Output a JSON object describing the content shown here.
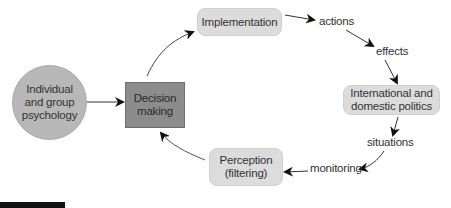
{
  "diagram": {
    "type": "cycle-flow",
    "nodes": {
      "psychology": {
        "label": "Individual and group psychology",
        "lines": [
          "Individual",
          "and group",
          "psychology"
        ],
        "shape": "circle",
        "color": "#b8b8b8"
      },
      "decision": {
        "label": "Decision making",
        "lines": [
          "Decision",
          "making"
        ],
        "shape": "rectangle",
        "color": "#8c8c8c"
      },
      "implementation": {
        "label": "Implementation",
        "lines": [
          "Implementation"
        ],
        "shape": "rounded-rectangle",
        "color": "#dcdcdc"
      },
      "politics": {
        "label": "International and domestic politics",
        "lines": [
          "International and",
          "domestic politics"
        ],
        "shape": "rounded-rectangle",
        "color": "#dcdcdc"
      },
      "perception": {
        "label": "Perception (filtering)",
        "lines": [
          "Perception",
          "(filtering)"
        ],
        "shape": "rounded-rectangle",
        "color": "#dcdcdc"
      }
    },
    "edge_labels": {
      "actions": "actions",
      "effects": "effects",
      "situations": "situations",
      "monitoring": "monitoring"
    },
    "edges": [
      {
        "from": "psychology",
        "to": "decision"
      },
      {
        "from": "decision",
        "to": "implementation"
      },
      {
        "from": "implementation",
        "to": "actions"
      },
      {
        "from": "actions",
        "to": "effects"
      },
      {
        "from": "effects",
        "to": "politics"
      },
      {
        "from": "politics",
        "to": "situations"
      },
      {
        "from": "situations",
        "to": "monitoring"
      },
      {
        "from": "monitoring",
        "to": "perception"
      },
      {
        "from": "perception",
        "to": "decision"
      }
    ]
  }
}
